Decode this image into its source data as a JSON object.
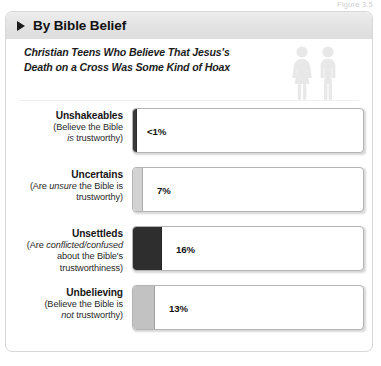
{
  "figure": {
    "label": "Figure 3.5"
  },
  "header": {
    "title": "By Bible Belief",
    "arrow_icon": "triangle-right-icon"
  },
  "subtitle": {
    "line1": "Christian Teens Who Believe That Jesus's",
    "line2": "Death on a Cross Was Some Kind of Hoax"
  },
  "icons": {
    "people": "two-people-icon",
    "female": "female-figure-icon",
    "male": "male-figure-icon"
  },
  "colors": {
    "header_band": "#e4e4e4",
    "bar_unshakeables": "#3a3a3a",
    "bar_uncertains": "#d2d2d2",
    "bar_unsettleds": "#2e2e2e",
    "bar_unbelieving": "#c2c2c2",
    "track_border": "#b4b4b4",
    "text": "#161616"
  },
  "chart_data": {
    "type": "bar",
    "title": "Christian Teens Who Believe That Jesus's Death on a Cross Was Some Kind of Hoax",
    "subtitle": "By Bible Belief",
    "xlabel": "",
    "ylabel": "",
    "xlim": [
      0,
      100
    ],
    "grid": false,
    "legend": "none",
    "orientation": "horizontal",
    "unit": "percent",
    "categories": [
      "Unshakeables",
      "Uncertains",
      "Unsettleds",
      "Unbelieving"
    ],
    "values": [
      0.5,
      7,
      16,
      13
    ],
    "value_labels": [
      "<1%",
      "7%",
      "16%",
      "13%"
    ],
    "rows": [
      {
        "title": "Unshakeables",
        "sub_pre": "(Believe the Bible",
        "sub_em": "is",
        "sub_post": " trustworthy)",
        "value_label": "<1%",
        "value": 0.5,
        "bar_width_px": 3,
        "bar_color": "#3a3a3a",
        "label_left_px": 14
      },
      {
        "title": "Uncertains",
        "sub_pre": "(Are ",
        "sub_em": "unsure",
        "sub_post": " the Bible is trustworthy)",
        "value_label": "7%",
        "value": 7,
        "bar_width_px": 9,
        "bar_color": "#d2d2d2",
        "label_left_px": 24
      },
      {
        "title": "Unsettleds",
        "sub_pre": "(Are ",
        "sub_em": "conflicted/confused",
        "sub_post": " about the Bible's trustworthiness)",
        "value_label": "16%",
        "value": 16,
        "bar_width_px": 28,
        "bar_color": "#2e2e2e",
        "label_left_px": 43
      },
      {
        "title": "Unbelieving",
        "sub_pre": "(Believe the Bible is ",
        "sub_em": "not",
        "sub_post": " trustworthy)",
        "value_label": "13%",
        "value": 13,
        "bar_width_px": 21,
        "bar_color": "#c2c2c2",
        "label_left_px": 36
      }
    ]
  }
}
